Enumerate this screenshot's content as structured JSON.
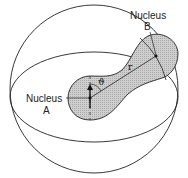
{
  "diagram": {
    "labels": {
      "nucleus_a_line1": "Nucleus",
      "nucleus_a_line2": "A",
      "nucleus_b_line1": "Nucleus",
      "nucleus_b_line2": "B",
      "distance": "r",
      "angle": "ϑ"
    },
    "colors": {
      "stroke": "#222222",
      "shade": "#c8c8c8",
      "background": "#ffffff"
    }
  }
}
